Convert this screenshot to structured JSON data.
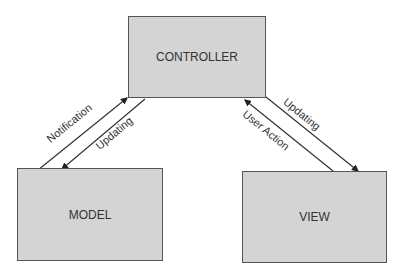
{
  "diagram": {
    "nodes": {
      "controller": "CONTROLLER",
      "model": "MODEL",
      "view": "VIEW"
    },
    "edges": [
      {
        "from": "MODEL",
        "to": "CONTROLLER",
        "label": "Notification"
      },
      {
        "from": "CONTROLLER",
        "to": "MODEL",
        "label": "Updating"
      },
      {
        "from": "VIEW",
        "to": "CONTROLLER",
        "label": "User Action"
      },
      {
        "from": "CONTROLLER",
        "to": "VIEW",
        "label": "Updating"
      }
    ],
    "colors": {
      "box_fill": "#d4d4d4",
      "box_border": "#555555",
      "line": "#222222"
    }
  }
}
